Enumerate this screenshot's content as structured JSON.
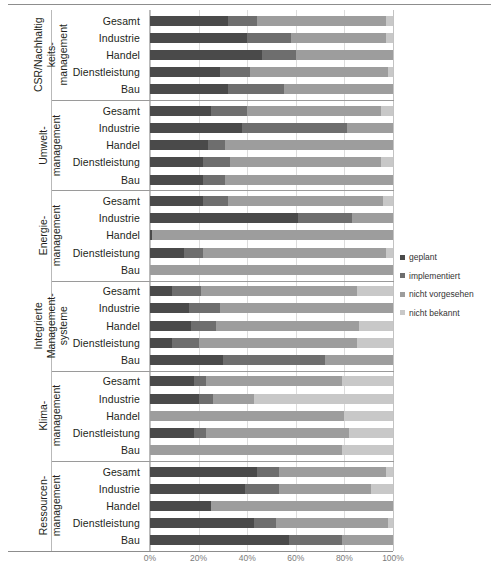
{
  "chart_data": {
    "type": "bar",
    "subtype": "stacked-horizontal-100-percent",
    "title": "",
    "xlabel": "",
    "ylabel": "",
    "xlim": [
      0,
      100
    ],
    "x_ticks": [
      "0%",
      "20%",
      "40%",
      "60%",
      "80%",
      "100%"
    ],
    "x_tick_values": [
      0,
      20,
      40,
      60,
      80,
      100
    ],
    "grid": true,
    "legend_position": "right",
    "categories": [
      "Gesamt",
      "Industrie",
      "Handel",
      "Dienstleistung",
      "Bau"
    ],
    "series": [
      {
        "name": "geplant",
        "color": "#4a4a4a"
      },
      {
        "name": "implementiert",
        "color": "#6e6e6e"
      },
      {
        "name": "nicht vorgesehen",
        "color": "#9d9d9d"
      },
      {
        "name": "nicht bekannt",
        "color": "#c8c8c8"
      }
    ],
    "groups": [
      {
        "name": "CSR/Nachhaltigkeits-management",
        "title_line1": "CSR/Nachhaltig",
        "title_line2": "keits-",
        "title_line3": "management",
        "rows": [
          {
            "label": "Gesamt",
            "values": [
              32,
              12,
              53,
              3
            ]
          },
          {
            "label": "Industrie",
            "values": [
              40,
              18,
              39,
              3
            ]
          },
          {
            "label": "Handel",
            "values": [
              46,
              14,
              40,
              0
            ]
          },
          {
            "label": "Dienstleistung",
            "values": [
              29,
              12,
              57,
              2
            ]
          },
          {
            "label": "Bau",
            "values": [
              32,
              23,
              45,
              0
            ]
          }
        ]
      },
      {
        "name": "Umwelt-management",
        "title_line1": "Umwelt-",
        "title_line2": "management",
        "title_line3": "",
        "rows": [
          {
            "label": "Gesamt",
            "values": [
              25,
              15,
              55,
              5
            ]
          },
          {
            "label": "Industrie",
            "values": [
              38,
              43,
              19,
              0
            ]
          },
          {
            "label": "Handel",
            "values": [
              24,
              7,
              69,
              0
            ]
          },
          {
            "label": "Dienstleistung",
            "values": [
              22,
              11,
              62,
              5
            ]
          },
          {
            "label": "Bau",
            "values": [
              22,
              9,
              69,
              0
            ]
          }
        ]
      },
      {
        "name": "Energie-management",
        "title_line1": "Energie-",
        "title_line2": "management",
        "title_line3": "",
        "rows": [
          {
            "label": "Gesamt",
            "values": [
              22,
              10,
              64,
              4
            ]
          },
          {
            "label": "Industrie",
            "values": [
              61,
              22,
              17,
              0
            ]
          },
          {
            "label": "Handel",
            "values": [
              1,
              0,
              99,
              0
            ]
          },
          {
            "label": "Dienstleistung",
            "values": [
              14,
              8,
              75,
              3
            ]
          },
          {
            "label": "Bau",
            "values": [
              0,
              0,
              100,
              0
            ]
          }
        ]
      },
      {
        "name": "Integrierte Management-systeme",
        "title_line1": "Integrierte",
        "title_line2": "Management-",
        "title_line3": "systeme",
        "rows": [
          {
            "label": "Gesamt",
            "values": [
              9,
              12,
              64,
              15
            ]
          },
          {
            "label": "Industrie",
            "values": [
              16,
              13,
              71,
              0
            ]
          },
          {
            "label": "Handel",
            "values": [
              17,
              10,
              59,
              14
            ]
          },
          {
            "label": "Dienstleistung",
            "values": [
              9,
              11,
              65,
              15
            ]
          },
          {
            "label": "Bau",
            "values": [
              30,
              42,
              28,
              0
            ]
          }
        ]
      },
      {
        "name": "Klima-management",
        "title_line1": "Klima-",
        "title_line2": "management",
        "title_line3": "",
        "rows": [
          {
            "label": "Gesamt",
            "values": [
              18,
              5,
              56,
              21
            ]
          },
          {
            "label": "Industrie",
            "values": [
              20,
              6,
              17,
              57
            ]
          },
          {
            "label": "Handel",
            "values": [
              0,
              0,
              80,
              20
            ]
          },
          {
            "label": "Dienstleistung",
            "values": [
              18,
              5,
              59,
              18
            ]
          },
          {
            "label": "Bau",
            "values": [
              0,
              0,
              79,
              21
            ]
          }
        ]
      },
      {
        "name": "Ressourcen-management",
        "title_line1": "Ressourcen-",
        "title_line2": "management",
        "title_line3": "",
        "rows": [
          {
            "label": "Gesamt",
            "values": [
              44,
              9,
              44,
              3
            ]
          },
          {
            "label": "Industrie",
            "values": [
              39,
              14,
              38,
              9
            ]
          },
          {
            "label": "Handel",
            "values": [
              25,
              0,
              75,
              0
            ]
          },
          {
            "label": "Dienstleistung",
            "values": [
              43,
              9,
              46,
              2
            ]
          },
          {
            "label": "Bau",
            "values": [
              57,
              22,
              21,
              0
            ]
          }
        ]
      }
    ]
  }
}
